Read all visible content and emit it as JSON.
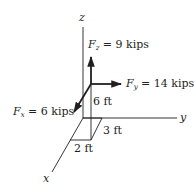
{
  "diagram": {
    "type": "3d-force-components",
    "axes": {
      "x": {
        "label": "x"
      },
      "y": {
        "label": "y"
      },
      "z": {
        "label": "z"
      }
    },
    "forces": [
      {
        "name": "Fx",
        "symbol": "F",
        "sub": "x",
        "eq": " = 6 kips",
        "value": 6,
        "unit": "kips",
        "direction": "x"
      },
      {
        "name": "Fy",
        "symbol": "F",
        "sub": "y",
        "eq": " = 14 kips",
        "value": 14,
        "unit": "kips",
        "direction": "y"
      },
      {
        "name": "Fz",
        "symbol": "F",
        "sub": "z",
        "eq": " = 9 kips",
        "value": 9,
        "unit": "kips",
        "direction": "z"
      }
    ],
    "dimensions": [
      {
        "label": "6 ft",
        "along": "z"
      },
      {
        "label": "3 ft",
        "along": "x"
      },
      {
        "label": "2 ft",
        "along": "y"
      }
    ],
    "colors": {
      "ink": "#231f20",
      "background": "#ffffff"
    }
  }
}
